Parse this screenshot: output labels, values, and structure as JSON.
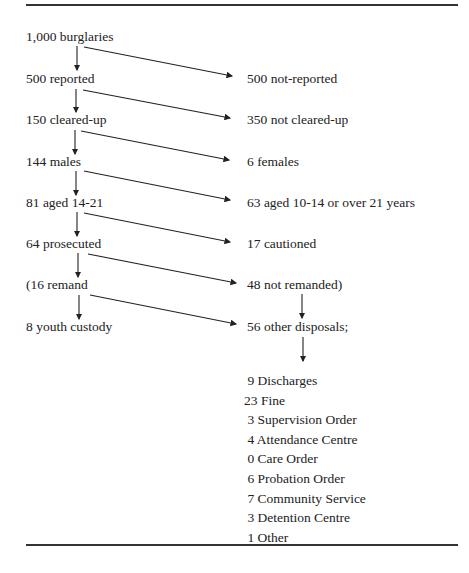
{
  "diagram": {
    "type": "attrition flow",
    "left_column": [
      {
        "id": "burglaries",
        "label": "1,000 burglaries"
      },
      {
        "id": "reported",
        "label": "500 reported"
      },
      {
        "id": "cleared",
        "label": "150 cleared-up"
      },
      {
        "id": "males",
        "label": "144 males"
      },
      {
        "id": "aged",
        "label": "81 aged 14-21"
      },
      {
        "id": "prosecuted",
        "label": "64 prosecuted"
      },
      {
        "id": "remand",
        "label": "(16 remand"
      },
      {
        "id": "youth_custody",
        "label": "8 youth custody"
      }
    ],
    "right_column": [
      {
        "id": "not_reported",
        "label": "500 not-reported"
      },
      {
        "id": "not_cleared",
        "label": "350 not cleared-up"
      },
      {
        "id": "females",
        "label": "6 females"
      },
      {
        "id": "other_age",
        "label": "63 aged 10-14 or over 21 years"
      },
      {
        "id": "cautioned",
        "label": "17 cautioned"
      },
      {
        "id": "not_remanded",
        "label": "48 not remanded)"
      },
      {
        "id": "other_disposals",
        "label": "56 other disposals;"
      }
    ],
    "disposals": [
      " 9 Discharges",
      "23 Fine",
      " 3 Supervision Order",
      " 4 Attendance Centre",
      " 0 Care Order",
      " 6 Probation Order",
      " 7 Community Service",
      " 3 Detention Centre",
      " 1 Other"
    ]
  }
}
